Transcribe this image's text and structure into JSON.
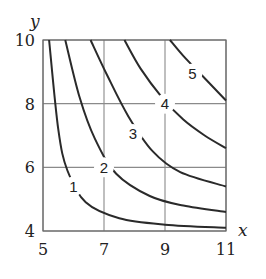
{
  "chart_data": {
    "type": "line",
    "title": "",
    "subtitle": "Contour plot (level curves)",
    "xlabel": "x",
    "ylabel": "y",
    "xlim": [
      5,
      11
    ],
    "ylim": [
      4,
      10
    ],
    "xticks": [
      5,
      7,
      9,
      11
    ],
    "yticks": [
      4,
      6,
      8,
      10
    ],
    "grid": true,
    "series": [
      {
        "name": "1",
        "label_at": [
          6.0,
          5.4
        ],
        "points": [
          [
            5.2,
            10
          ],
          [
            5.5,
            7.2
          ],
          [
            5.8,
            5.9
          ],
          [
            6.4,
            4.9
          ],
          [
            7.5,
            4.4
          ],
          [
            9,
            4.2
          ],
          [
            11,
            4.1
          ]
        ]
      },
      {
        "name": "2",
        "label_at": [
          7.0,
          6.0
        ],
        "points": [
          [
            5.73,
            10
          ],
          [
            6.2,
            8.2
          ],
          [
            6.7,
            6.9
          ],
          [
            7.4,
            5.8
          ],
          [
            8.5,
            5.1
          ],
          [
            9.6,
            4.8
          ],
          [
            11,
            4.6
          ]
        ]
      },
      {
        "name": "3",
        "label_at": [
          7.95,
          7.05
        ],
        "points": [
          [
            6.56,
            10
          ],
          [
            7.1,
            8.9
          ],
          [
            7.8,
            7.6
          ],
          [
            8.6,
            6.5
          ],
          [
            9.5,
            5.85
          ],
          [
            11,
            5.4
          ]
        ]
      },
      {
        "name": "4",
        "label_at": [
          9.0,
          8.0
        ],
        "points": [
          [
            7.67,
            10
          ],
          [
            8.2,
            9.1
          ],
          [
            8.9,
            8.2
          ],
          [
            9.6,
            7.5
          ],
          [
            10.3,
            7.0
          ],
          [
            11,
            6.6
          ]
        ]
      },
      {
        "name": "5",
        "label_at": [
          9.9,
          8.95
        ],
        "points": [
          [
            9.16,
            10
          ],
          [
            9.6,
            9.5
          ],
          [
            10.2,
            8.9
          ],
          [
            10.6,
            8.5
          ],
          [
            11,
            8.1
          ]
        ]
      }
    ]
  }
}
